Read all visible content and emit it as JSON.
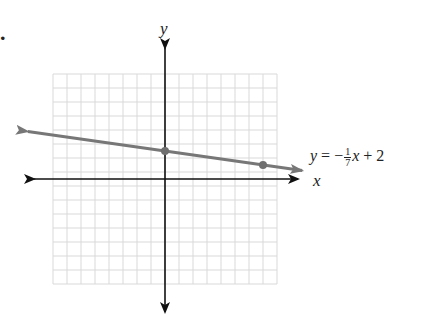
{
  "problem": {
    "marker": "."
  },
  "graph": {
    "x_axis_label": "x",
    "y_axis_label": "y",
    "equation": {
      "lhs": "y",
      "equals": "=",
      "sign": "−",
      "numerator": "1",
      "denominator": "7",
      "variable": "x",
      "plus": "+",
      "constant": "2"
    },
    "colors": {
      "grid": "#d9d9d9",
      "axes": "#111111",
      "line": "#777777",
      "points": "#6f6f6f"
    }
  },
  "chart_data": {
    "type": "line",
    "title": "",
    "xlabel": "x",
    "ylabel": "y",
    "xlim": [
      -8,
      8
    ],
    "ylim": [
      -7.5,
      7.5
    ],
    "grid": true,
    "legend": "none",
    "series": [
      {
        "name": "y = -1/7 x + 2",
        "slope": -0.142857,
        "intercept": 2,
        "x": [
          -10,
          10
        ],
        "y": [
          3.43,
          0.57
        ]
      }
    ],
    "points": [
      {
        "x": 0,
        "y": 2,
        "label": "y-intercept"
      },
      {
        "x": 7,
        "y": 1,
        "label": ""
      }
    ],
    "annotations": [
      "y = −¹⁄₇x + 2"
    ]
  }
}
